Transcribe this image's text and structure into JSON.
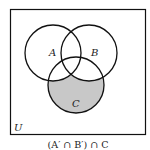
{
  "diagram": {
    "type": "venn",
    "universe_label": "U",
    "sets": [
      {
        "name": "A",
        "cx": 53,
        "cy": 53,
        "r": 28
      },
      {
        "name": "B",
        "cx": 89,
        "cy": 53,
        "r": 28
      },
      {
        "name": "C",
        "cx": 76,
        "cy": 85,
        "r": 28
      }
    ],
    "shaded_region": "C only (outside A and B)",
    "shade_color": "#c8c8c8",
    "stroke_color": "#111111",
    "caption": "(A′ ∩ B′) ∩ C"
  }
}
